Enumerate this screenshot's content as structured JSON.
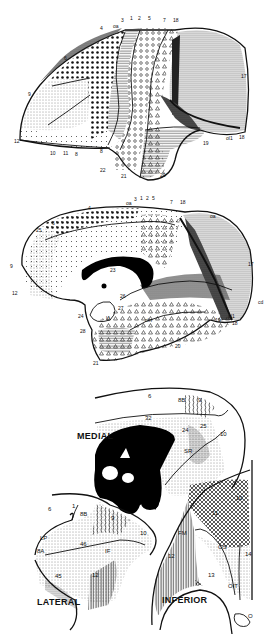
{
  "figure": {
    "panels": [
      {
        "id": "lateral-hemisphere",
        "view": "lateral surface of hemisphere",
        "labels": [
          "1",
          "2",
          "3",
          "4",
          "5",
          "6",
          "7",
          "8",
          "9",
          "10",
          "11",
          "12",
          "17",
          "18",
          "19",
          "20",
          "21",
          "22",
          "oa",
          "ol1",
          "18b"
        ]
      },
      {
        "id": "medial-hemisphere",
        "view": "medial surface of hemisphere",
        "labels": [
          "1",
          "2",
          "3",
          "4",
          "5",
          "6",
          "7",
          "9",
          "12",
          "17",
          "18",
          "19",
          "20",
          "21",
          "23",
          "24",
          "25",
          "26",
          "27",
          "28",
          "oa",
          "cd",
          "ol1",
          "oln",
          "U",
          "18"
        ]
      },
      {
        "id": "frontal-maps",
        "views": [
          "MEDIAL",
          "LATERAL",
          "INFERIOR"
        ]
      }
    ],
    "lateral": {
      "top_labels": [
        "4",
        "oa",
        "3",
        "1",
        "2",
        "5",
        "7",
        "18"
      ],
      "side_labels": {
        "a6": "6",
        "a9": "9",
        "a12": "12",
        "a10": "10",
        "a11": "11",
        "a8": "8",
        "a22": "22",
        "a21": "21",
        "a20": "20",
        "a19": "19",
        "a17": "17",
        "a18": "18",
        "ol": "ol1"
      }
    },
    "medial": {
      "top_labels": [
        "4",
        "oa",
        "3",
        "1",
        "2",
        "5",
        "7",
        "18"
      ],
      "side_labels": {
        "a6": "6",
        "a25": "25",
        "a9": "9",
        "a12": "12",
        "a23": "23",
        "a24": "24",
        "a26": "26",
        "a27": "27",
        "a28": "28",
        "u": "U",
        "a21": "21",
        "a20": "20",
        "a19": "19",
        "a18": "18",
        "a17": "17",
        "cd": "cd",
        "ol": "ol1",
        "oln": "oln",
        "a18b": "18"
      }
    },
    "frontal_medial": {
      "title": "MEDIAL",
      "labels": {
        "a6": "6",
        "a8b": "8B",
        "a9": "9",
        "a32": "32",
        "a24": "24",
        "a25": "25",
        "a10": "10",
        "sr": "SR"
      }
    },
    "frontal_lateral": {
      "title": "LATERAL",
      "labels": {
        "a6": "6",
        "a8b": "8B",
        "a9": "9",
        "a10": "10",
        "lp": "LP",
        "a8a": "8A",
        "a46": "46",
        "if": "IF",
        "a45": "45",
        "a12": "12",
        "a1": "1"
      }
    },
    "frontal_inferior": {
      "title": "INFERIOR",
      "labels": {
        "a10": "10",
        "a11": "11",
        "fm": "FM",
        "a12": "12",
        "os": "OS",
        "a14": "14",
        "a13": "13",
        "oit": "OIT",
        "o": "O"
      }
    }
  },
  "colors": {
    "ink": "#111111",
    "paper": "#ffffff"
  }
}
